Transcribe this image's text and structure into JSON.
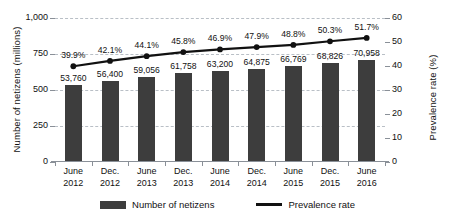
{
  "chart_data": {
    "type": "bar",
    "title": "",
    "subtitle": "",
    "xlabel": "",
    "ylabel": "Number of netizens (millions)",
    "y2label": "Prevalence rate (%)",
    "ylim": [
      0,
      1000
    ],
    "y2lim": [
      0,
      60
    ],
    "grid": true,
    "legend_position": "bottom",
    "categories": [
      "June 2012",
      "Dec. 2012",
      "June 2013",
      "Dec. 2013",
      "June 2014",
      "Dec. 2014",
      "June 2015",
      "Dec. 2015",
      "June 2016"
    ],
    "categories_lines": [
      [
        "June",
        "2012"
      ],
      [
        "Dec.",
        "2012"
      ],
      [
        "June",
        "2013"
      ],
      [
        "Dec.",
        "2013"
      ],
      [
        "June",
        "2014"
      ],
      [
        "Dec.",
        "2014"
      ],
      [
        "June",
        "2015"
      ],
      [
        "Dec.",
        "2015"
      ],
      [
        "June",
        "2016"
      ]
    ],
    "series": [
      {
        "name": "Number of netizens",
        "type": "bar",
        "axis": "left",
        "color": "#3d3d3d",
        "values": [
          53760,
          56400,
          59056,
          61758,
          63200,
          64875,
          66769,
          68826,
          70958
        ],
        "value_labels": [
          "53,760",
          "56,400",
          "59,056",
          "61,758",
          "63,200",
          "64,875",
          "66,769",
          "68,826",
          "70,958"
        ],
        "plotted_values": [
          537.6,
          564.0,
          590.56,
          617.58,
          632.0,
          648.75,
          667.69,
          688.26,
          709.58
        ]
      },
      {
        "name": "Prevalence rate",
        "type": "line",
        "axis": "right",
        "color": "#111111",
        "values": [
          39.9,
          42.1,
          44.1,
          45.8,
          46.9,
          47.9,
          48.8,
          50.3,
          51.7
        ],
        "value_labels": [
          "39.9%",
          "42.1%",
          "44.1%",
          "45.8%",
          "46.9%",
          "47.9%",
          "48.8%",
          "50.3%",
          "51.7%"
        ]
      }
    ],
    "yticks_left": [
      "0",
      "250",
      "500",
      "750",
      "1,000"
    ],
    "yticks_left_values": [
      0,
      250,
      500,
      750,
      1000
    ],
    "yticks_right": [
      "0",
      "10",
      "20",
      "30",
      "40",
      "50",
      "60"
    ],
    "yticks_right_values": [
      0,
      10,
      20,
      30,
      40,
      50,
      60
    ]
  },
  "legend": {
    "items": [
      {
        "label": "Number of netizens",
        "marker": "bar-swatch",
        "color": "#3d3d3d"
      },
      {
        "label": "Prevalence rate",
        "marker": "line-swatch",
        "color": "#111111"
      }
    ]
  },
  "colors": {
    "bar": "#3d3d3d",
    "line": "#111111",
    "grid": "#b9bfc6",
    "axis": "#8a9098",
    "background": "#ffffff",
    "text": "#111111"
  }
}
